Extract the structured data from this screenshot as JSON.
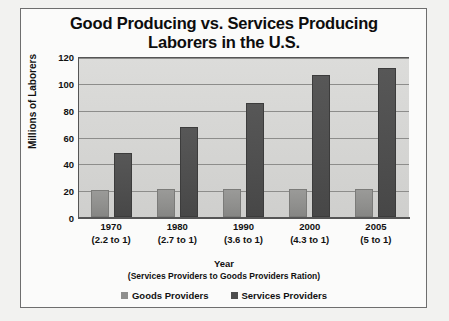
{
  "chart_data": {
    "type": "bar",
    "title": "Good Producing vs. Services Producing Laborers in the U.S.",
    "title_line1": "Good Producing vs. Services Producing",
    "title_line2": "Laborers in the U.S.",
    "xlabel": "Year",
    "xlabel_sub": "(Services Providers to Goods Providers Ration)",
    "ylabel": "Millions of Laborers",
    "ylim": [
      0,
      120
    ],
    "yticks": [
      120,
      100,
      80,
      60,
      40,
      20,
      0
    ],
    "grid": true,
    "legend_position": "bottom",
    "categories": [
      "1970",
      "1980",
      "1990",
      "2000",
      "2005"
    ],
    "category_sublabels": [
      "(2.2 to 1)",
      "(2.7 to 1)",
      "(3.6 to 1)",
      "(4.3 to 1)",
      "(5 to 1)"
    ],
    "series": [
      {
        "name": "Goods Providers",
        "color": "#8f8f8d",
        "values": [
          20,
          21,
          21,
          21,
          21
        ]
      },
      {
        "name": "Services Providers",
        "color": "#4e4e4e",
        "values": [
          48,
          67,
          85,
          106,
          111
        ]
      }
    ]
  },
  "colors": {
    "plot_background": "#d5d5d3",
    "gridline": "#8d8d8b",
    "axis": "#555555",
    "text": "#111111",
    "page_background": "#f2f2f0",
    "frame_border": "#6e6e6e"
  }
}
